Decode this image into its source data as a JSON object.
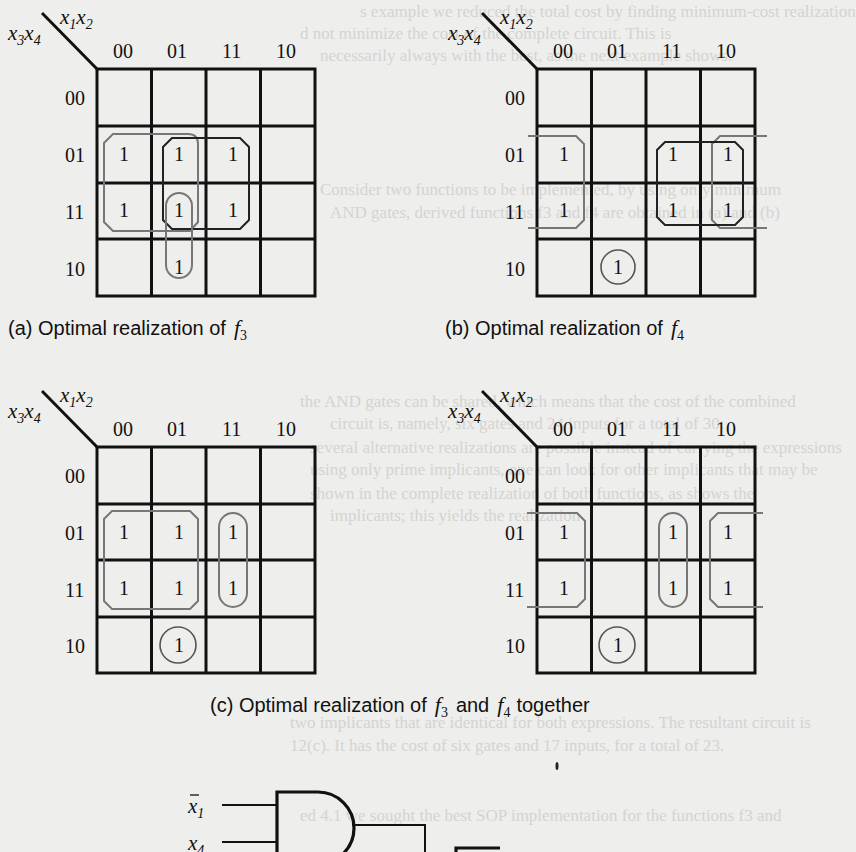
{
  "figure": {
    "kmaps": [
      {
        "id": "a",
        "col_var": "x1x2",
        "row_var": "x3x4",
        "col_labels": [
          "00",
          "01",
          "11",
          "10"
        ],
        "row_labels": [
          "00",
          "01",
          "11",
          "10"
        ],
        "cells": [
          [
            "",
            "",
            "",
            ""
          ],
          [
            "1",
            "1",
            "1",
            ""
          ],
          [
            "1",
            "1",
            "1",
            ""
          ],
          [
            "",
            "1",
            "",
            ""
          ]
        ],
        "groups": [
          {
            "rows": [
              1,
              2
            ],
            "cols": [
              0,
              1
            ],
            "style": "gray"
          },
          {
            "rows": [
              1,
              2
            ],
            "cols": [
              1,
              2
            ],
            "style": "black"
          },
          {
            "rows": [
              2,
              3
            ],
            "cols": [
              1,
              1
            ],
            "style": "gray"
          }
        ],
        "caption": "(a) Optimal realization of",
        "caption_fn": "f",
        "caption_sub": "3"
      },
      {
        "id": "b",
        "col_var": "x1x2",
        "row_var": "x3x4",
        "col_labels": [
          "00",
          "01",
          "11",
          "10"
        ],
        "row_labels": [
          "00",
          "01",
          "11",
          "10"
        ],
        "cells": [
          [
            "",
            "",
            "",
            ""
          ],
          [
            "1",
            "",
            "1",
            "1"
          ],
          [
            "1",
            "",
            "1",
            "1"
          ],
          [
            "",
            "1",
            "",
            ""
          ]
        ],
        "groups": [
          {
            "rows": [
              1,
              2
            ],
            "cols": [
              0,
              0
            ],
            "style": "gray-wrap-left"
          },
          {
            "rows": [
              1,
              2
            ],
            "cols": [
              2,
              3
            ],
            "style": "black"
          },
          {
            "rows": [
              1,
              2
            ],
            "cols": [
              3,
              3
            ],
            "style": "gray-wrap-right"
          },
          {
            "rows": [
              3,
              3
            ],
            "cols": [
              1,
              1
            ],
            "style": "circle"
          }
        ],
        "caption": "(b) Optimal realization of",
        "caption_fn": "f",
        "caption_sub": "4"
      },
      {
        "id": "c-f3",
        "col_var": "x1x2",
        "row_var": "x3x4",
        "col_labels": [
          "00",
          "01",
          "11",
          "10"
        ],
        "row_labels": [
          "00",
          "01",
          "11",
          "10"
        ],
        "cells": [
          [
            "",
            "",
            "",
            ""
          ],
          [
            "1",
            "1",
            "1",
            ""
          ],
          [
            "1",
            "1",
            "1",
            ""
          ],
          [
            "",
            "1",
            "",
            ""
          ]
        ],
        "groups": [
          {
            "rows": [
              1,
              2
            ],
            "cols": [
              0,
              1
            ],
            "style": "gray"
          },
          {
            "rows": [
              1,
              2
            ],
            "cols": [
              2,
              2
            ],
            "style": "gray"
          },
          {
            "rows": [
              3,
              3
            ],
            "cols": [
              1,
              1
            ],
            "style": "circle"
          }
        ]
      },
      {
        "id": "c-f4",
        "col_var": "x1x2",
        "row_var": "x3x4",
        "col_labels": [
          "00",
          "01",
          "11",
          "10"
        ],
        "row_labels": [
          "00",
          "01",
          "11",
          "10"
        ],
        "cells": [
          [
            "",
            "",
            "",
            ""
          ],
          [
            "1",
            "",
            "1",
            "1"
          ],
          [
            "1",
            "",
            "1",
            "1"
          ],
          [
            "",
            "1",
            "",
            ""
          ]
        ],
        "groups": [
          {
            "rows": [
              1,
              2
            ],
            "cols": [
              0,
              0
            ],
            "style": "gray-wrap-left"
          },
          {
            "rows": [
              1,
              2
            ],
            "cols": [
              2,
              2
            ],
            "style": "gray"
          },
          {
            "rows": [
              1,
              2
            ],
            "cols": [
              3,
              3
            ],
            "style": "gray-wrap-right"
          },
          {
            "rows": [
              3,
              3
            ],
            "cols": [
              1,
              1
            ],
            "style": "circle"
          }
        ]
      }
    ],
    "caption_c": {
      "prefix": "(c) Optimal realization of",
      "f1": "f",
      "f1_sub": "3",
      "middle": "and",
      "f2": "f",
      "f2_sub": "4",
      "suffix": "together"
    },
    "gate": {
      "inputs": [
        {
          "name": "x",
          "sub": "1",
          "bar": true
        },
        {
          "name": "x",
          "sub": "4",
          "bar": false
        }
      ],
      "type": "AND"
    }
  },
  "labels": {
    "x": "x",
    "sub1": "1",
    "sub2": "2",
    "sub3": "3",
    "sub4": "4"
  },
  "bleed_through": [
    "s example we reduced the total cost by finding minimum-cost realization",
    "d not minimize the cost of the complete circuit. This is",
    "necessarily always with the best, as the next example shows.",
    "Consider two functions to be implemented, by using only minimum",
    "AND gates, derived functions f3 and f4 are obtained in (a) and (b)",
    "the AND gates can be shared, which means that the cost of the combined",
    "circuit is, namely, six gates and 24 inputs for a total of 30.",
    "several alternative realizations are possible instead of carrying the expressions",
    "using only prime implicants, one can look for other implicants that may be",
    "shown in the complete realization of both functions, as shows the",
    "implicants; this yields the realization",
    "two implicants that are identical for both expressions. The resultant circuit is",
    "12(c). It has the cost of six gates and 17 inputs, for a total of 23.",
    "ed 4.1 we sought the best SOP implementation for the functions f3 and"
  ]
}
